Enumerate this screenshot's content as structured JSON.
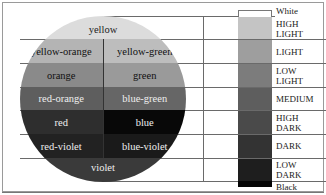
{
  "wheel": {
    "bands": [
      {
        "cells": [
          {
            "label": "yellow",
            "bg": "#dcdcdc",
            "fg": "#222"
          }
        ]
      },
      {
        "cells": [
          {
            "label": "yellow-orange",
            "bg": "#b4b4b4",
            "fg": "#111"
          },
          {
            "label": "yellow-green",
            "bg": "#bdbdbd",
            "fg": "#111"
          }
        ]
      },
      {
        "cells": [
          {
            "label": "orange",
            "bg": "#8a8a8a",
            "fg": "#111"
          },
          {
            "label": "green",
            "bg": "#9a9a9a",
            "fg": "#111"
          }
        ]
      },
      {
        "cells": [
          {
            "label": "red-orange",
            "bg": "#5e5e5e",
            "fg": "#eee"
          },
          {
            "label": "blue-green",
            "bg": "#666666",
            "fg": "#eee"
          }
        ]
      },
      {
        "cells": [
          {
            "label": "red",
            "bg": "#2e2e2e",
            "fg": "#eee"
          },
          {
            "label": "blue",
            "bg": "#080808",
            "fg": "#eee"
          }
        ]
      },
      {
        "cells": [
          {
            "label": "red-violet",
            "bg": "#222222",
            "fg": "#eee"
          },
          {
            "label": "blue-violet",
            "bg": "#1a1a1a",
            "fg": "#eee"
          }
        ]
      },
      {
        "cells": [
          {
            "label": "violet",
            "bg": "#3a3a3a",
            "fg": "#eee"
          }
        ]
      }
    ]
  },
  "scale": {
    "levels": [
      {
        "label": "White",
        "bg": "#ffffff"
      },
      {
        "label": "HIGH LIGHT",
        "bg": "#c4c4c4"
      },
      {
        "label": "LIGHT",
        "bg": "#9e9e9e"
      },
      {
        "label": "LOW LIGHT",
        "bg": "#7c7c7c"
      },
      {
        "label": "MEDIUM",
        "bg": "#5e5e5e"
      },
      {
        "label": "HIGH DARK",
        "bg": "#4a4a4a"
      },
      {
        "label": "DARK",
        "bg": "#333333"
      },
      {
        "label": "LOW DARK",
        "bg": "#1e1e1e"
      },
      {
        "label": "Black",
        "bg": "#050505"
      }
    ]
  }
}
